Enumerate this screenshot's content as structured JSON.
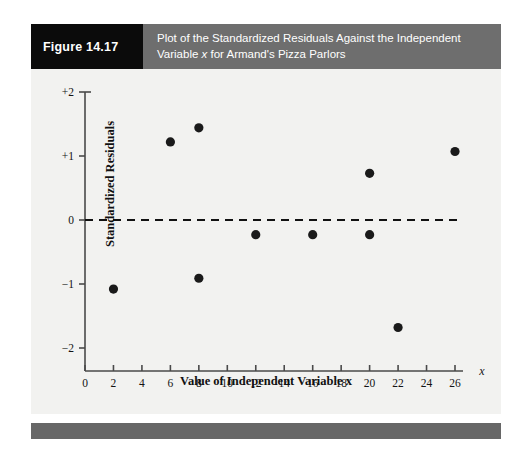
{
  "figure": {
    "tag": "Figure 14.17",
    "caption_line1": "Plot of the Standardized Residuals Against the Independent",
    "caption_line2_pre": "Variable ",
    "caption_line2_var": "x",
    "caption_line2_post": " for Armand's Pizza Parlors",
    "tag_bg": "#0b0b0b",
    "caption_bg": "#6e6e6e",
    "panel_bg": "#f2f2f0",
    "footer_bg": "#676767"
  },
  "chart_data": {
    "type": "scatter",
    "title": "Plot of the Standardized Residuals Against the Independent Variable x for Armand's Pizza Parlors",
    "xlabel": "Value of Independent Variable x",
    "ylabel": "Standardized Residuals",
    "xlim": [
      0,
      26
    ],
    "ylim": [
      -2,
      2
    ],
    "xticks": [
      0,
      2,
      4,
      6,
      8,
      10,
      12,
      14,
      16,
      18,
      20,
      22,
      24,
      26
    ],
    "xtick_labels": [
      "0",
      "2",
      "4",
      "6",
      "8",
      "10",
      "12",
      "14",
      "16",
      "18",
      "20",
      "22",
      "24",
      "26"
    ],
    "yticks": [
      -2,
      -1,
      0,
      1,
      2
    ],
    "ytick_labels": [
      "−2",
      "−1",
      "0",
      "+1",
      "+2"
    ],
    "grid": false,
    "legend": null,
    "x_axis_variable": "x",
    "reference_line": {
      "y": 0,
      "style": "dashed",
      "color": "#111111"
    },
    "marker": {
      "shape": "circle",
      "color": "#1a1a1a",
      "size": 4.6
    },
    "x": [
      2,
      6,
      8,
      8,
      12,
      16,
      20,
      20,
      22,
      26
    ],
    "y": [
      -1.08,
      1.22,
      1.44,
      -0.91,
      -0.23,
      -0.23,
      0.73,
      -0.23,
      -1.68,
      1.07
    ],
    "points": [
      {
        "x": 2,
        "y": -1.08
      },
      {
        "x": 6,
        "y": 1.22
      },
      {
        "x": 8,
        "y": 1.44
      },
      {
        "x": 8,
        "y": -0.91
      },
      {
        "x": 12,
        "y": -0.23
      },
      {
        "x": 16,
        "y": -0.23
      },
      {
        "x": 20,
        "y": 0.73
      },
      {
        "x": 20,
        "y": -0.23
      },
      {
        "x": 22,
        "y": -1.68
      },
      {
        "x": 26,
        "y": 1.07
      }
    ]
  }
}
